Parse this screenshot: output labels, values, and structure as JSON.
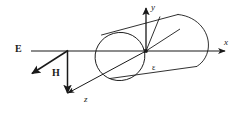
{
  "figure": {
    "title_visible": false,
    "background_color": "#ffffff",
    "stroke_color": "#1a1a1a",
    "labels": {
      "x_axis": "x",
      "y_axis": "y",
      "z_axis": "z",
      "e_field": "E",
      "h_field": "H",
      "permittivity": "ε"
    }
  },
  "diagram_data": {
    "type": "vector-geometry-diagram",
    "subject": "plane electromagnetic wave incident on a dielectric cylinder",
    "axes": [
      {
        "name": "x",
        "label": "x",
        "direction": "right",
        "arrow": true
      },
      {
        "name": "y",
        "label": "y",
        "direction": "up",
        "arrow": true
      },
      {
        "name": "z",
        "label": "z",
        "direction": "down-left",
        "arrow": true
      }
    ],
    "vectors": [
      {
        "name": "E",
        "label": "E",
        "direction": "down-left",
        "bold": true,
        "arrow": true
      },
      {
        "name": "H",
        "label": "H",
        "direction": "down",
        "bold": true,
        "arrow": true
      }
    ],
    "objects": [
      {
        "name": "cylinder",
        "label": "ε",
        "shape": "circular cylinder tilted along the z-x plane",
        "near_end": "ellipse outline",
        "far_end": "rounded cap"
      }
    ],
    "origin": {
      "x": 146,
      "y": 51,
      "marked": true
    }
  }
}
